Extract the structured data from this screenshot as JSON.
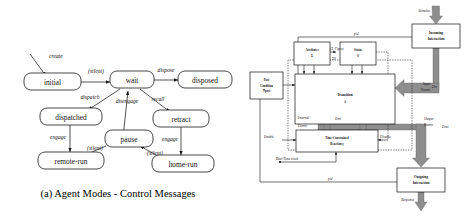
{
  "figure": {
    "caption_a": "(a) Agent Modes - Control Messages"
  },
  "left_diagram": {
    "name": "agent-modes-state-machine",
    "states": [
      {
        "id": "initial",
        "label": "initial"
      },
      {
        "id": "wait",
        "label": "wait"
      },
      {
        "id": "disposed",
        "label": "disposed"
      },
      {
        "id": "dispatched",
        "label": "dispatched"
      },
      {
        "id": "retract",
        "label": "retract"
      },
      {
        "id": "pause",
        "label": "pause"
      },
      {
        "id": "remote-run",
        "label": "remote-run"
      },
      {
        "id": "home-run",
        "label": "home-run"
      }
    ],
    "transitions": [
      {
        "from": "",
        "to": "initial",
        "label": "create"
      },
      {
        "from": "initial",
        "to": "wait",
        "label": "(silent)"
      },
      {
        "from": "wait",
        "to": "disposed",
        "label": "dispose"
      },
      {
        "from": "wait",
        "to": "dispatched",
        "label": "dispatch"
      },
      {
        "from": "pause",
        "to": "wait",
        "label": "disengage"
      },
      {
        "from": "wait",
        "to": "retract",
        "label": "recall"
      },
      {
        "from": "dispatched",
        "to": "remote-run",
        "label": "engage"
      },
      {
        "from": "pause",
        "to": "remote-run",
        "label": "(silent)"
      },
      {
        "from": "retract",
        "to": "home-run",
        "label": "engage"
      },
      {
        "from": "pause",
        "to": "home-run",
        "label": "(silent)"
      }
    ]
  },
  "right_diagram": {
    "name": "agent-execution-architecture",
    "blocks": [
      {
        "id": "incoming-interaction",
        "line1": "Incoming",
        "line2": "Interaction"
      },
      {
        "id": "outgoing-interaction",
        "line1": "Outgoing",
        "line2": "Interaction"
      },
      {
        "id": "attributes",
        "line1": "Attributes",
        "line2": "Σ"
      },
      {
        "id": "status",
        "line1": "Status",
        "line2": "θ"
      },
      {
        "id": "transition",
        "line1": "Transition",
        "line2": "λ"
      },
      {
        "id": "time-constrained-reaction",
        "line1": "Time-Constrained",
        "line2": "Reaction    γ"
      },
      {
        "id": "post-condition",
        "line1": "Post",
        "line2": "Condition",
        "line3": "Ψpost"
      }
    ],
    "edge_labels": [
      {
        "id": "stimulus",
        "text": "Stimulus"
      },
      {
        "id": "response",
        "text": "Response"
      },
      {
        "id": "pid-top",
        "text": "pid"
      },
      {
        "id": "pid-bottom",
        "text": "pid"
      },
      {
        "id": "input-events",
        "line1": "Input",
        "line2": "Events",
        "sub": "Σin"
      },
      {
        "id": "output-events",
        "line1": "Output",
        "line2": "Events",
        "sub": "Σout"
      },
      {
        "id": "internal-events",
        "line1": "Internal",
        "line2": "Events",
        "sub": "Σint"
      },
      {
        "id": "enable",
        "text": "Enable"
      },
      {
        "id": "disable",
        "text": "Disable"
      },
      {
        "id": "real-time-clock",
        "text": "Real-Time clock"
      },
      {
        "id": "sigma-theta",
        "text": "Σθ"
      },
      {
        "id": "sigma-post",
        "text": "(Σ, Γ)post"
      }
    ]
  }
}
